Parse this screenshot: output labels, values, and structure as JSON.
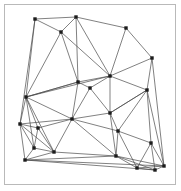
{
  "figure": {
    "width": 181,
    "height": 191
  },
  "panel": {
    "background_color": "#ffffff",
    "border_color": "#b9b9b9",
    "border_width": 1,
    "inset_left": 4,
    "inset_top": 4,
    "inner_width": 172,
    "inner_height": 181
  },
  "style": {
    "edge_color": "#4a4a4a",
    "edge_width": 0.7,
    "node_color": "#1c1c1c",
    "node_shape": "square",
    "node_size": 3.4
  },
  "chart_data": {
    "type": "scatter",
    "xlabel": "",
    "ylabel": "",
    "xlim": [
      0,
      181
    ],
    "ylim": [
      0,
      191
    ],
    "grid": false,
    "legend": "none",
    "node_count": 28,
    "edge_count": 69,
    "nodes": [
      {
        "id": 0,
        "label": "n0",
        "x": 35,
        "y": 19
      },
      {
        "id": 1,
        "label": "n1",
        "x": 76,
        "y": 17
      },
      {
        "id": 2,
        "label": "n2",
        "x": 61,
        "y": 32
      },
      {
        "id": 3,
        "label": "n3",
        "x": 126,
        "y": 28
      },
      {
        "id": 4,
        "label": "n4",
        "x": 152,
        "y": 58
      },
      {
        "id": 5,
        "label": "n5",
        "x": 110,
        "y": 76
      },
      {
        "id": 6,
        "label": "n6",
        "x": 78,
        "y": 82
      },
      {
        "id": 7,
        "label": "n7",
        "x": 90,
        "y": 88
      },
      {
        "id": 8,
        "label": "n8",
        "x": 147,
        "y": 90
      },
      {
        "id": 9,
        "label": "n9",
        "x": 26,
        "y": 97
      },
      {
        "id": 10,
        "label": "n10",
        "x": 110,
        "y": 113
      },
      {
        "id": 11,
        "label": "n11",
        "x": 72,
        "y": 119
      },
      {
        "id": 12,
        "label": "n12",
        "x": 20,
        "y": 124
      },
      {
        "id": 13,
        "label": "n13",
        "x": 38,
        "y": 128
      },
      {
        "id": 14,
        "label": "n14",
        "x": 118,
        "y": 131
      },
      {
        "id": 15,
        "label": "n15",
        "x": 151,
        "y": 143
      },
      {
        "id": 16,
        "label": "n16",
        "x": 34,
        "y": 148
      },
      {
        "id": 17,
        "label": "n17",
        "x": 54,
        "y": 152
      },
      {
        "id": 18,
        "label": "n18",
        "x": 25,
        "y": 160
      },
      {
        "id": 19,
        "label": "n19",
        "x": 116,
        "y": 156
      },
      {
        "id": 20,
        "label": "n20",
        "x": 137,
        "y": 168
      },
      {
        "id": 21,
        "label": "n21",
        "x": 164,
        "y": 166
      },
      {
        "id": 22,
        "label": "n22",
        "x": 155,
        "y": 170
      }
    ],
    "edges": [
      [
        0,
        1
      ],
      [
        0,
        2
      ],
      [
        0,
        9
      ],
      [
        0,
        12
      ],
      [
        1,
        2
      ],
      [
        1,
        3
      ],
      [
        1,
        5
      ],
      [
        1,
        6
      ],
      [
        2,
        6
      ],
      [
        2,
        9
      ],
      [
        2,
        5
      ],
      [
        3,
        4
      ],
      [
        3,
        5
      ],
      [
        4,
        5
      ],
      [
        4,
        8
      ],
      [
        4,
        21
      ],
      [
        5,
        6
      ],
      [
        5,
        7
      ],
      [
        5,
        8
      ],
      [
        5,
        10
      ],
      [
        5,
        9
      ],
      [
        6,
        7
      ],
      [
        6,
        9
      ],
      [
        6,
        11
      ],
      [
        7,
        10
      ],
      [
        7,
        11
      ],
      [
        8,
        10
      ],
      [
        8,
        14
      ],
      [
        8,
        15
      ],
      [
        8,
        21
      ],
      [
        9,
        11
      ],
      [
        9,
        12
      ],
      [
        9,
        13
      ],
      [
        9,
        6
      ],
      [
        10,
        11
      ],
      [
        10,
        14
      ],
      [
        10,
        19
      ],
      [
        10,
        8
      ],
      [
        11,
        13
      ],
      [
        11,
        14
      ],
      [
        11,
        17
      ],
      [
        11,
        19
      ],
      [
        12,
        13
      ],
      [
        12,
        16
      ],
      [
        12,
        18
      ],
      [
        13,
        16
      ],
      [
        13,
        17
      ],
      [
        14,
        15
      ],
      [
        14,
        19
      ],
      [
        14,
        20
      ],
      [
        15,
        20
      ],
      [
        15,
        21
      ],
      [
        15,
        22
      ],
      [
        16,
        17
      ],
      [
        16,
        18
      ],
      [
        17,
        18
      ],
      [
        17,
        19
      ],
      [
        18,
        19
      ],
      [
        18,
        21
      ],
      [
        18,
        22
      ],
      [
        19,
        20
      ],
      [
        19,
        22
      ],
      [
        19,
        21
      ],
      [
        20,
        21
      ],
      [
        20,
        22
      ],
      [
        21,
        22
      ],
      [
        9,
        17
      ],
      [
        9,
        16
      ],
      [
        11,
        12
      ],
      [
        12,
        17
      ]
    ]
  }
}
